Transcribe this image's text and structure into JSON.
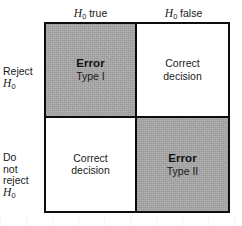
{
  "figure": {
    "colors": {
      "shaded_cell": "#a9a9a9",
      "plain_cell": "#ffffff",
      "border": "#0d0d0d",
      "text": "#1a1a1a",
      "background": "#ffffff"
    }
  },
  "columns": [
    {
      "key": "h0_true",
      "label_var": "H",
      "label_sub": "0",
      "label_rest": " true"
    },
    {
      "key": "h0_false",
      "label_var": "H",
      "label_sub": "0",
      "label_rest": " false"
    }
  ],
  "rows": [
    {
      "key": "reject",
      "lines": [
        "Reject"
      ],
      "var": "H",
      "sub": "0"
    },
    {
      "key": "do_not_reject",
      "lines": [
        "Do",
        "not",
        "reject"
      ],
      "var": "H",
      "sub": "0"
    }
  ],
  "cells": {
    "top_left": {
      "primary": "Error",
      "secondary": "Type I",
      "shaded": true
    },
    "top_right": {
      "line1": "Correct",
      "line2": "decision",
      "shaded": false
    },
    "bottom_left": {
      "line1": "Correct",
      "line2": "decision",
      "shaded": false
    },
    "bottom_right": {
      "primary": "Error",
      "secondary": "Type II",
      "shaded": true
    }
  }
}
